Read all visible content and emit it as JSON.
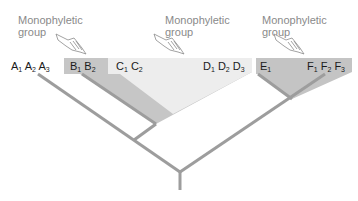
{
  "diagram": {
    "group_labels": [
      {
        "line1": "Monophyletic",
        "line2": "group",
        "target": "B"
      },
      {
        "line1": "Monophyletic",
        "line2": "group",
        "target": "C-D"
      },
      {
        "line1": "Monophyletic",
        "line2": "group",
        "target": "E-F"
      }
    ],
    "taxa": [
      {
        "id": "A",
        "text": [
          "A",
          "1",
          " A",
          "2",
          " A",
          "3"
        ]
      },
      {
        "id": "B",
        "text": [
          "B",
          "1",
          " B",
          "2"
        ]
      },
      {
        "id": "C",
        "text": [
          "C",
          "1",
          " C",
          "2"
        ]
      },
      {
        "id": "D",
        "text": [
          "D",
          "1",
          " D",
          "2",
          " D",
          "3"
        ]
      },
      {
        "id": "E",
        "text": [
          "E",
          "1"
        ]
      },
      {
        "id": "F",
        "text": [
          "F",
          "1",
          " F",
          "2",
          " F",
          "3"
        ]
      }
    ],
    "icons": [
      "pointing-hand-icon",
      "pointing-hand-icon",
      "pointing-hand-icon"
    ],
    "colors": {
      "branch": "#9a9a9a",
      "clade_dark": "#c4c4c4",
      "clade_light": "#ececec",
      "label_text": "#8a8a8a",
      "taxon_text": "#1a1a1a"
    }
  }
}
